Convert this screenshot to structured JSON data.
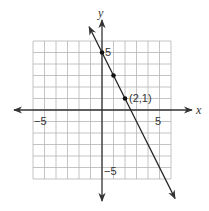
{
  "chart_data": {
    "type": "line",
    "title": "",
    "xlabel": "x",
    "ylabel": "y",
    "xlim": [
      -6,
      6
    ],
    "ylim": [
      -6,
      6
    ],
    "grid": true,
    "tick_labels": {
      "x": [
        {
          "value": -5,
          "label": "−5"
        },
        {
          "value": 5,
          "label": "5"
        }
      ],
      "y": [
        {
          "value": 5,
          "label": "5"
        },
        {
          "value": -5,
          "label": "−5"
        }
      ]
    },
    "series": [
      {
        "name": "line",
        "equation": "y = -2x + 5",
        "x": [
          0,
          1,
          2
        ],
        "y": [
          5,
          3,
          1
        ]
      }
    ],
    "annotations": [
      {
        "x": 2,
        "y": 1,
        "text": "(2,1)"
      }
    ]
  },
  "labels": {
    "x_axis": "x",
    "y_axis": "y",
    "x_neg5": "−5",
    "x_pos5": "5",
    "y_pos5": "5",
    "y_neg5": "−5",
    "point_label": "(2,1)"
  },
  "colors": {
    "grid": "#b5b5b5",
    "axis": "#333333",
    "line": "#222222"
  }
}
